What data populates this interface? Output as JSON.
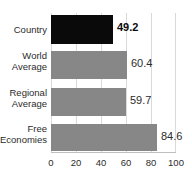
{
  "chart_data": {
    "type": "bar",
    "orientation": "horizontal",
    "title": "",
    "xlabel": "",
    "ylabel": "",
    "categories": [
      "Country",
      "World Average",
      "Regional Average",
      "Free Economies"
    ],
    "values": [
      49.2,
      59.7,
      60.4,
      84.6
    ],
    "series": [
      {
        "name": "Score",
        "values": [
          49.2,
          60.4,
          59.7,
          84.6
        ]
      }
    ],
    "bars": [
      {
        "label_line1": "Country",
        "label_line2": "",
        "value": 49.2,
        "value_text": "49.2",
        "color": "#0a0a0a",
        "emphasis": true
      },
      {
        "label_line1": "World",
        "label_line2": "Average",
        "value": 60.4,
        "value_text": "60.4",
        "color": "#878787",
        "emphasis": false
      },
      {
        "label_line1": "Regional",
        "label_line2": "Average",
        "value": 59.7,
        "value_text": "59.7",
        "color": "#878787",
        "emphasis": false
      },
      {
        "label_line1": "Free",
        "label_line2": "Economies",
        "value": 84.6,
        "value_text": "84.6",
        "color": "#878787",
        "emphasis": false
      }
    ],
    "xlim": [
      0,
      100
    ],
    "xticks": [
      0,
      20,
      40,
      60,
      80,
      100
    ],
    "xtick_labels": [
      "0",
      "20",
      "40",
      "60",
      "80",
      "100"
    ],
    "grid": true,
    "grid_color": "#d9d9d9",
    "legend": null,
    "background": "#ffffff"
  }
}
